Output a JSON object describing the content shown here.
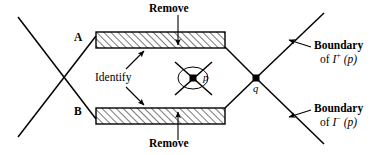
{
  "figure": {
    "labels": {
      "remove_top": "Remove",
      "remove_bottom": "Remove",
      "region_a": "A",
      "region_b": "B",
      "identify": "Identify",
      "point_p": "p",
      "point_q": "q",
      "boundary_plus_line1": "Boundary",
      "boundary_plus_prefix": "of ",
      "boundary_plus_symbol": "I",
      "boundary_plus_sup": "+",
      "boundary_plus_arg": "(p)",
      "boundary_minus_line1": "Boundary",
      "boundary_minus_prefix": "of ",
      "boundary_minus_symbol": "I",
      "boundary_minus_sup": "−",
      "boundary_minus_arg": "(p)"
    },
    "colors": {
      "stroke": "#000000",
      "background": "#ffffff",
      "hatch": "#000000"
    }
  }
}
